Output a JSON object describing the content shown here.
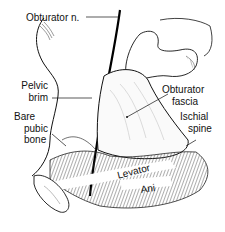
{
  "figure": {
    "labels": {
      "obturator_nerve": "Obturator n.",
      "pelvic_brim_line1": "Pelvic",
      "pelvic_brim_line2": "brim",
      "bare_pubic_bone_line1": "Bare",
      "bare_pubic_bone_line2": "pubic",
      "bare_pubic_bone_line3": "bone",
      "obturator_fascia_line1": "Obturator",
      "obturator_fascia_line2": "fascia",
      "ischial_spine_line1": "Ischial",
      "ischial_spine_line2": "spine",
      "levator": "Levator",
      "ani": "Ani"
    },
    "colors": {
      "ink": "#111111",
      "background": "#ffffff"
    }
  }
}
